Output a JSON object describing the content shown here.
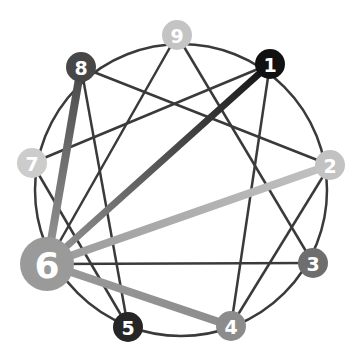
{
  "diagram": {
    "type": "enneagram",
    "circle": {
      "cx": 181,
      "cy": 190,
      "r": 150,
      "color": "#3a3a3a"
    },
    "nodes": [
      {
        "id": "1",
        "label": "1",
        "x": 270,
        "y": 64,
        "r": 15,
        "color": "#111111",
        "font": 19
      },
      {
        "id": "2",
        "label": "2",
        "x": 330,
        "y": 165,
        "r": 15,
        "color": "#c2c2c2",
        "font": 19
      },
      {
        "id": "3",
        "label": "3",
        "x": 313,
        "y": 263,
        "r": 15,
        "color": "#6e6e6e",
        "font": 19
      },
      {
        "id": "4",
        "label": "4",
        "x": 231,
        "y": 326,
        "r": 15,
        "color": "#8c8c8c",
        "font": 19
      },
      {
        "id": "5",
        "label": "5",
        "x": 128,
        "y": 327,
        "r": 15,
        "color": "#262626",
        "font": 19
      },
      {
        "id": "6",
        "label": "6",
        "x": 47,
        "y": 264,
        "r": 27,
        "color": "#9a9a9a",
        "font": 36
      },
      {
        "id": "7",
        "label": "7",
        "x": 32,
        "y": 163,
        "r": 15,
        "color": "#cccccc",
        "font": 19
      },
      {
        "id": "8",
        "label": "8",
        "x": 81,
        "y": 67,
        "r": 15,
        "color": "#474747",
        "font": 19
      },
      {
        "id": "9",
        "label": "9",
        "x": 177,
        "y": 35,
        "r": 15,
        "color": "#c4c4c4",
        "font": 19
      }
    ],
    "thin_edges": [
      [
        "9",
        "3"
      ],
      [
        "9",
        "6"
      ],
      [
        "3",
        "6"
      ],
      [
        "1",
        "4"
      ],
      [
        "4",
        "2"
      ],
      [
        "2",
        "8"
      ],
      [
        "8",
        "5"
      ],
      [
        "5",
        "7"
      ],
      [
        "7",
        "1"
      ]
    ],
    "thick_edges": [
      {
        "from": "6",
        "to": "1",
        "width": 7,
        "gradient": [
          "#9a9a9a",
          "#111111"
        ]
      },
      {
        "from": "6",
        "to": "2",
        "width": 8,
        "gradient": [
          "#9a9a9a",
          "#c2c2c2"
        ]
      },
      {
        "from": "6",
        "to": "4",
        "width": 8,
        "gradient": [
          "#9a9a9a",
          "#8c8c8c"
        ]
      },
      {
        "from": "6",
        "to": "8",
        "width": 8,
        "gradient": [
          "#9a9a9a",
          "#474747"
        ]
      }
    ]
  }
}
